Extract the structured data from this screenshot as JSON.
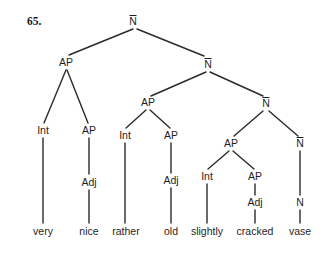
{
  "example_number": "65.",
  "colors": {
    "line": "#2a2a2a",
    "text": "#1e1e1e",
    "background": "#ffffff"
  },
  "tree": {
    "nodes": [
      {
        "id": "n0",
        "label": "N",
        "bar": true,
        "x": 133,
        "y": 25
      },
      {
        "id": "n1",
        "label": "AP",
        "bar": false,
        "x": 66,
        "y": 66
      },
      {
        "id": "n2",
        "label": "N",
        "bar": true,
        "x": 208,
        "y": 68
      },
      {
        "id": "n3",
        "label": "Int",
        "bar": false,
        "x": 43,
        "y": 134
      },
      {
        "id": "n4",
        "label": "AP",
        "bar": false,
        "x": 89,
        "y": 134
      },
      {
        "id": "n5",
        "label": "Adj",
        "bar": false,
        "x": 89,
        "y": 186
      },
      {
        "id": "n6",
        "label": "AP",
        "bar": false,
        "x": 148,
        "y": 106
      },
      {
        "id": "n7",
        "label": "N",
        "bar": true,
        "x": 266,
        "y": 107
      },
      {
        "id": "n8",
        "label": "Int",
        "bar": false,
        "x": 125,
        "y": 139
      },
      {
        "id": "n9",
        "label": "AP",
        "bar": false,
        "x": 171,
        "y": 139
      },
      {
        "id": "n10",
        "label": "Adj",
        "bar": false,
        "x": 171,
        "y": 184
      },
      {
        "id": "n11",
        "label": "AP",
        "bar": false,
        "x": 231,
        "y": 147
      },
      {
        "id": "n12",
        "label": "N",
        "bar": true,
        "x": 300,
        "y": 147
      },
      {
        "id": "n13",
        "label": "Int",
        "bar": false,
        "x": 207,
        "y": 180
      },
      {
        "id": "n14",
        "label": "AP",
        "bar": false,
        "x": 255,
        "y": 180
      },
      {
        "id": "n15",
        "label": "Adj",
        "bar": false,
        "x": 255,
        "y": 206
      },
      {
        "id": "n16",
        "label": "N",
        "bar": false,
        "x": 300,
        "y": 206
      }
    ],
    "words": [
      {
        "text": "very",
        "x": 43,
        "y": 235
      },
      {
        "text": "nice",
        "x": 89,
        "y": 235
      },
      {
        "text": "rather",
        "x": 126,
        "y": 235
      },
      {
        "text": "old",
        "x": 171,
        "y": 235
      },
      {
        "text": "slightly",
        "x": 207,
        "y": 235
      },
      {
        "text": "cracked",
        "x": 255,
        "y": 235
      },
      {
        "text": "vase",
        "x": 300,
        "y": 235
      }
    ],
    "edges": [
      [
        133,
        29,
        69,
        55
      ],
      [
        137,
        29,
        204,
        56
      ],
      [
        66,
        70,
        44,
        123
      ],
      [
        67,
        70,
        88,
        123
      ],
      [
        43,
        138,
        43,
        223
      ],
      [
        89,
        138,
        89,
        174
      ],
      [
        89,
        190,
        89,
        223
      ],
      [
        206,
        72,
        151,
        96
      ],
      [
        210,
        72,
        263,
        96
      ],
      [
        146,
        110,
        126,
        128
      ],
      [
        150,
        110,
        170,
        128
      ],
      [
        125,
        143,
        125,
        223
      ],
      [
        171,
        143,
        171,
        173
      ],
      [
        171,
        188,
        171,
        223
      ],
      [
        263,
        111,
        234,
        136
      ],
      [
        269,
        111,
        298,
        136
      ],
      [
        229,
        151,
        208,
        169
      ],
      [
        233,
        151,
        254,
        169
      ],
      [
        207,
        184,
        207,
        223
      ],
      [
        255,
        184,
        255,
        195
      ],
      [
        255,
        210,
        255,
        223
      ],
      [
        300,
        151,
        300,
        195
      ],
      [
        300,
        210,
        300,
        223
      ]
    ]
  }
}
